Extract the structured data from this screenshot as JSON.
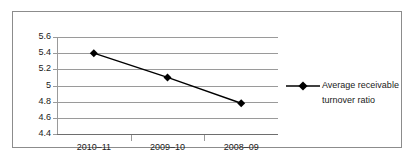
{
  "chart_data": {
    "type": "line",
    "title": "",
    "subtitle": "",
    "xlabel": "",
    "ylabel": "",
    "categories": [
      "2010–11",
      "2009–10",
      "2008–09"
    ],
    "series": [
      {
        "name": "Average receivable turnover ratio",
        "values": [
          5.4,
          5.1,
          4.78
        ],
        "marker": "diamond",
        "color": "#000000"
      }
    ],
    "ylim": [
      4.4,
      5.6
    ],
    "yticks": [
      4.4,
      4.6,
      4.8,
      5,
      5.2,
      5.4,
      5.6
    ],
    "ytick_labels": [
      "4.4",
      "4.6",
      "4.8",
      "5",
      "5.2",
      "5.4",
      "5.6"
    ],
    "grid": true,
    "grid_axis": "y",
    "legend": true,
    "legend_position": "right",
    "legend_entries": [
      "Average receivable turnover ratio"
    ]
  },
  "legend": {
    "entry_label": "Average receivable turnover ratio"
  },
  "colors": {
    "series": "#000000",
    "gridline": "#9a9a9a",
    "frame_border": "#8c8c8c",
    "axis": "#6e6e6e",
    "text": "#1a1a1a",
    "background": "#ffffff"
  }
}
